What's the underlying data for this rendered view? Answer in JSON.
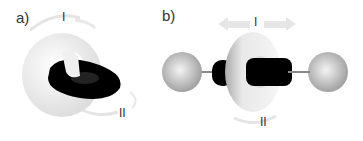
{
  "figure": {
    "panels": [
      {
        "id": "a",
        "label": "a)",
        "subject": "catenane (two interlocked rings)",
        "motion_labels": [
          "I",
          "II"
        ]
      },
      {
        "id": "b",
        "label": "b)",
        "subject": "rotaxane (ring threaded on axle with spherical stoppers)",
        "motion_labels": [
          "I",
          "II"
        ]
      }
    ],
    "colors": {
      "light_ring": "#eeeeee",
      "dark_ring": "#000000",
      "stopper": "#b5b5b5",
      "arrow": "#e6e6e6",
      "label": "#333333"
    }
  }
}
